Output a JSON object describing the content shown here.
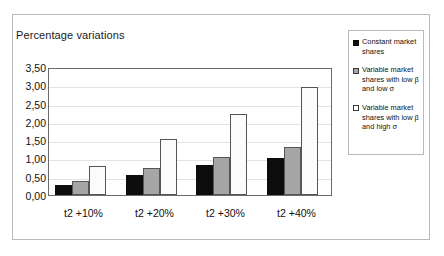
{
  "chart_data": {
    "type": "bar",
    "title": "Percentage variations",
    "xlabel": "",
    "ylabel": "",
    "ylim": [
      0,
      3.5
    ],
    "ytick_labels": [
      "3,50",
      "3,00",
      "2,50",
      "2,00",
      "1,50",
      "1,00",
      "0,50",
      "0,00"
    ],
    "ytick_values": [
      3.5,
      3.0,
      2.5,
      2.0,
      1.5,
      1.0,
      0.5,
      0.0
    ],
    "grid": true,
    "legend_position": "right",
    "categories": [
      "t2 +10%",
      "t2 +20%",
      "t2 +30%",
      "t2 +40%"
    ],
    "series": [
      {
        "name": "Constant market shares",
        "color": "#0d0d0d",
        "values": [
          0.27,
          0.55,
          0.83,
          1.0
        ]
      },
      {
        "name": "Variable market shares with low β and low σ",
        "color": "#a6a6a6",
        "values": [
          0.38,
          0.75,
          1.03,
          1.3
        ]
      },
      {
        "name": "Variable market shares with low β and high σ",
        "color": "#fbfbfb",
        "values": [
          0.78,
          1.54,
          2.22,
          2.94
        ]
      }
    ]
  },
  "legend": {
    "items": [
      {
        "label": "Constant market shares",
        "swatch": "series-0-swatch"
      },
      {
        "label": "Variable market shares with low β and low σ",
        "swatch": "series-1-swatch"
      },
      {
        "label": "Variable market shares with low β and high σ",
        "swatch": "series-2-swatch"
      }
    ]
  }
}
